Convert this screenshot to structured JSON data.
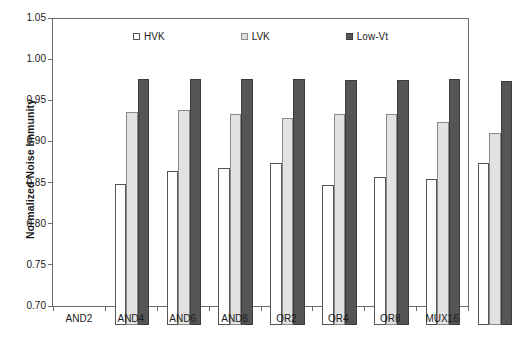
{
  "chart_data": {
    "type": "bar",
    "title": "",
    "xlabel": "",
    "ylabel": "Normalized Noise Immunity",
    "ylim": [
      0.7,
      1.05
    ],
    "ytick_labels": [
      "1.05",
      "1.00",
      "0.95",
      "0.90",
      "0.85",
      "0.80",
      "0.75",
      "0.70"
    ],
    "ytick_values": [
      1.05,
      1.0,
      0.95,
      0.9,
      0.85,
      0.8,
      0.75,
      0.7
    ],
    "grid": false,
    "legend_position": "top-inside",
    "categories": [
      "AND2",
      "AND4",
      "AND6",
      "AND8",
      "OR2",
      "OR4",
      "OR8",
      "MUX16"
    ],
    "series": [
      {
        "name": "HVK",
        "color": "#ffffff",
        "edge_color": "#555555",
        "values": [
          0.872,
          0.888,
          0.892,
          0.898,
          0.871,
          0.881,
          0.878,
          0.897
        ]
      },
      {
        "name": "LVK",
        "color": "#e2e2e2",
        "edge_color": "#8a8a8a",
        "values": [
          0.96,
          0.962,
          0.957,
          0.953,
          0.957,
          0.957,
          0.948,
          0.934
        ]
      },
      {
        "name": "Low-Vt",
        "color": "#555555",
        "edge_color": "#3d3d3d",
        "values": [
          1.0,
          1.0,
          1.0,
          1.0,
          0.999,
          0.999,
          1.0,
          0.998
        ]
      }
    ]
  },
  "axes": {
    "frame_color": "#6b6b6b",
    "background": "#ffffff"
  }
}
